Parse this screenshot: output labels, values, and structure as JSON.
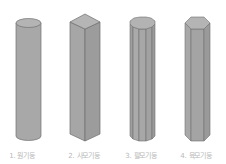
{
  "figure": {
    "items": [
      {
        "number": "1.",
        "name": "원기둥",
        "label": "1. 원기둥",
        "shape": "cylinder"
      },
      {
        "number": "2.",
        "name": "사모기둥",
        "label": "2. 사모기둥",
        "shape": "square-prism"
      },
      {
        "number": "3.",
        "name": "팔모기둥",
        "label": "3. 팔모기둥",
        "shape": "octagonal-prism"
      },
      {
        "number": "4.",
        "name": "육모기둥",
        "label": "4. 육모기둥",
        "shape": "hexagonal-prism"
      }
    ],
    "colors": {
      "face": "#a9a9a9",
      "face_dark": "#9a9a9a",
      "top": "#b5b5b5",
      "edge": "#6e6e6e",
      "label": "#b8b8b8"
    }
  }
}
